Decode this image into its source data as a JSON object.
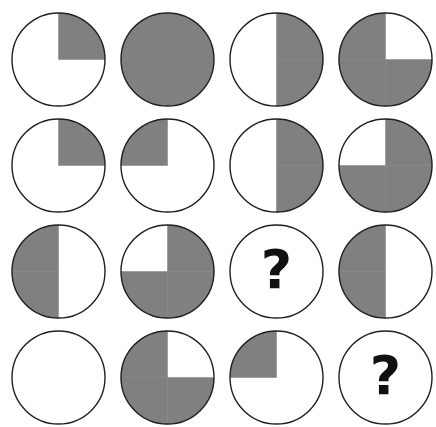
{
  "puzzle": {
    "title": "Shaded circle matrix reasoning puzzle",
    "background_color": "#ffffff",
    "shade_color": "#808080",
    "outline_color": "#231f20",
    "question_mark_color": "#111111",
    "question_mark_glyph": "?",
    "grid": {
      "rows": 4,
      "columns": 4
    },
    "circle": {
      "diameter_px": 93,
      "outline_width_px": 1.4
    },
    "cells": [
      {
        "row": 1,
        "col": 1,
        "name": "circle-r1c1",
        "fill_type": "quarter",
        "shaded_quadrants": [
          "top-right"
        ],
        "shaded_fraction": 0.25,
        "label": ""
      },
      {
        "row": 1,
        "col": 2,
        "name": "circle-r1c2",
        "fill_type": "full",
        "shaded_quadrants": [
          "top-left",
          "top-right",
          "bottom-right",
          "bottom-left"
        ],
        "shaded_fraction": 1.0,
        "label": ""
      },
      {
        "row": 1,
        "col": 3,
        "name": "circle-r1c3",
        "fill_type": "half",
        "shaded_quadrants": [
          "top-right",
          "bottom-right"
        ],
        "shaded_fraction": 0.5,
        "label": ""
      },
      {
        "row": 1,
        "col": 4,
        "name": "circle-r1c4",
        "fill_type": "three-quarters",
        "shaded_quadrants": [
          "top-left",
          "bottom-right",
          "bottom-left"
        ],
        "shaded_fraction": 0.75,
        "label": ""
      },
      {
        "row": 2,
        "col": 1,
        "name": "circle-r2c1",
        "fill_type": "quarter",
        "shaded_quadrants": [
          "top-right"
        ],
        "shaded_fraction": 0.25,
        "label": ""
      },
      {
        "row": 2,
        "col": 2,
        "name": "circle-r2c2",
        "fill_type": "quarter",
        "shaded_quadrants": [
          "top-left"
        ],
        "shaded_fraction": 0.25,
        "label": ""
      },
      {
        "row": 2,
        "col": 3,
        "name": "circle-r2c3",
        "fill_type": "half",
        "shaded_quadrants": [
          "top-right",
          "bottom-right"
        ],
        "shaded_fraction": 0.5,
        "label": ""
      },
      {
        "row": 2,
        "col": 4,
        "name": "circle-r2c4",
        "fill_type": "three-quarters",
        "shaded_quadrants": [
          "top-right",
          "bottom-right",
          "bottom-left"
        ],
        "shaded_fraction": 0.75,
        "label": ""
      },
      {
        "row": 3,
        "col": 1,
        "name": "circle-r3c1",
        "fill_type": "half",
        "shaded_quadrants": [
          "top-left",
          "bottom-left"
        ],
        "shaded_fraction": 0.5,
        "label": ""
      },
      {
        "row": 3,
        "col": 2,
        "name": "circle-r3c2",
        "fill_type": "three-quarters",
        "shaded_quadrants": [
          "top-right",
          "bottom-right",
          "bottom-left"
        ],
        "shaded_fraction": 0.75,
        "label": ""
      },
      {
        "row": 3,
        "col": 3,
        "name": "circle-r3c3",
        "fill_type": "question",
        "shaded_quadrants": [],
        "shaded_fraction": 0,
        "label": "?"
      },
      {
        "row": 3,
        "col": 4,
        "name": "circle-r3c4",
        "fill_type": "half",
        "shaded_quadrants": [
          "top-left",
          "bottom-left"
        ],
        "shaded_fraction": 0.5,
        "label": ""
      },
      {
        "row": 4,
        "col": 1,
        "name": "circle-r4c1",
        "fill_type": "empty",
        "shaded_quadrants": [],
        "shaded_fraction": 0,
        "label": ""
      },
      {
        "row": 4,
        "col": 2,
        "name": "circle-r4c2",
        "fill_type": "three-quarters",
        "shaded_quadrants": [
          "top-left",
          "bottom-right",
          "bottom-left"
        ],
        "shaded_fraction": 0.75,
        "label": ""
      },
      {
        "row": 4,
        "col": 3,
        "name": "circle-r4c3",
        "fill_type": "quarter",
        "shaded_quadrants": [
          "top-left"
        ],
        "shaded_fraction": 0.25,
        "label": ""
      },
      {
        "row": 4,
        "col": 4,
        "name": "circle-r4c4",
        "fill_type": "question",
        "shaded_quadrants": [],
        "shaded_fraction": 0,
        "label": "?"
      }
    ]
  }
}
